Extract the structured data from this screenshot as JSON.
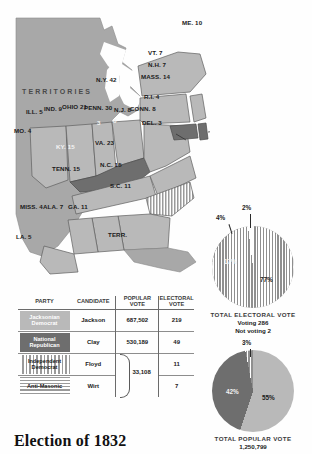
{
  "title": "Election of 1832",
  "map": {
    "territories_label": "TERRITORIES",
    "states": [
      {
        "name": "ME.",
        "votes": "10",
        "label": "ME. 10",
        "party": "jacksonian"
      },
      {
        "name": "VT.",
        "votes": "7",
        "label": "VT. 7",
        "party": "anti-masonic"
      },
      {
        "name": "N.H.",
        "votes": "7",
        "label": "N.H. 7",
        "party": "jacksonian"
      },
      {
        "name": "MASS.",
        "votes": "14",
        "label": "MASS. 14",
        "party": "national-republican"
      },
      {
        "name": "R.I.",
        "votes": "4",
        "label": "R.I. 4",
        "party": "national-republican"
      },
      {
        "name": "CONN.",
        "votes": "8",
        "label": "CONN. 8",
        "party": "national-republican"
      },
      {
        "name": "N.Y.",
        "votes": "42",
        "label": "N.Y. 42",
        "party": "jacksonian"
      },
      {
        "name": "PENN.",
        "votes": "30",
        "label": "PENN. 30",
        "party": "jacksonian"
      },
      {
        "name": "N.J.",
        "votes": "8",
        "label": "N.J. 8",
        "party": "jacksonian"
      },
      {
        "name": "DEL.",
        "votes": "3",
        "label": "DEL. 3",
        "party": "national-republican"
      },
      {
        "name": "MD.",
        "votes": "8",
        "label": "8",
        "party": "national-republican"
      },
      {
        "name": "OHIO",
        "votes": "21",
        "label": "OHIO 21",
        "party": "jacksonian"
      },
      {
        "name": "IND.",
        "votes": "9",
        "label": "IND. 9",
        "party": "jacksonian"
      },
      {
        "name": "ILL.",
        "votes": "5",
        "label": "ILL. 5",
        "party": "jacksonian"
      },
      {
        "name": "MO.",
        "votes": "4",
        "label": "MO. 4",
        "party": "jacksonian"
      },
      {
        "name": "KY.",
        "votes": "15",
        "label": "KY. 15",
        "party": "national-republican"
      },
      {
        "name": "VA.",
        "votes": "23",
        "label": "VA. 23",
        "party": "jacksonian"
      },
      {
        "name": "TENN.",
        "votes": "15",
        "label": "TENN. 15",
        "party": "jacksonian"
      },
      {
        "name": "N.C.",
        "votes": "15",
        "label": "N.C. 15",
        "party": "jacksonian"
      },
      {
        "name": "S.C.",
        "votes": "11",
        "label": "S.C. 11",
        "party": "independent-democrat"
      },
      {
        "name": "GA.",
        "votes": "11",
        "label": "GA. 11",
        "party": "jacksonian"
      },
      {
        "name": "ALA.",
        "votes": "7",
        "label": "ALA. 7",
        "party": "jacksonian"
      },
      {
        "name": "MISS.",
        "votes": "4",
        "label": "MISS. 4",
        "party": "jacksonian"
      },
      {
        "name": "LA.",
        "votes": "5",
        "label": "LA. 5",
        "party": "jacksonian"
      },
      {
        "name": "TERR.",
        "votes": "",
        "label": "TERR.",
        "party": "territory"
      },
      {
        "name": "DEL-connector",
        "votes": "3",
        "label": "3",
        "party": "national-republican"
      }
    ]
  },
  "table": {
    "headers": {
      "party": "PARTY",
      "candidate": "CANDIDATE",
      "popular_vote": "POPULAR VOTE",
      "electoral_vote": "ELECTORAL VOTE"
    },
    "rows": [
      {
        "party": "Jacksonian Democrat",
        "candidate": "Jackson",
        "popular": "687,502",
        "electoral": "219"
      },
      {
        "party": "National Republican",
        "candidate": "Clay",
        "popular": "530,189",
        "electoral": "49"
      },
      {
        "party": "Independent Democrat",
        "candidate": "Floyd",
        "popular": "",
        "electoral": "11"
      },
      {
        "party": "Anti-Masonic",
        "candidate": "Wirt",
        "popular": "",
        "electoral": "7"
      }
    ],
    "grouped_popular_vote": "33,108"
  },
  "charts": [
    {
      "id": "electoral",
      "type": "pie",
      "title": "TOTAL ELECTORAL VOTE",
      "subtitle_lines": [
        "Voting 286",
        "Not voting 2"
      ],
      "labels": [
        "77%",
        "17%",
        "4%",
        "2%"
      ],
      "values": [
        77,
        17,
        4,
        2
      ],
      "series_names": [
        "Jacksonian Democrat",
        "National Republican",
        "Independent Democrat",
        "Anti-Masonic"
      ]
    },
    {
      "id": "popular",
      "type": "pie",
      "title": "TOTAL POPULAR VOTE",
      "subtitle_lines": [
        "1,250,799"
      ],
      "labels": [
        "55%",
        "42%",
        "3%"
      ],
      "values": [
        55,
        42,
        3
      ],
      "series_names": [
        "Jacksonian Democrat",
        "National Republican",
        "Other"
      ]
    }
  ],
  "colors": {
    "jacksonian": "#b9b9b9",
    "national_republican": "#6e6e6e",
    "land": "#a8a8a8",
    "stroke": "#5f5f5f"
  }
}
